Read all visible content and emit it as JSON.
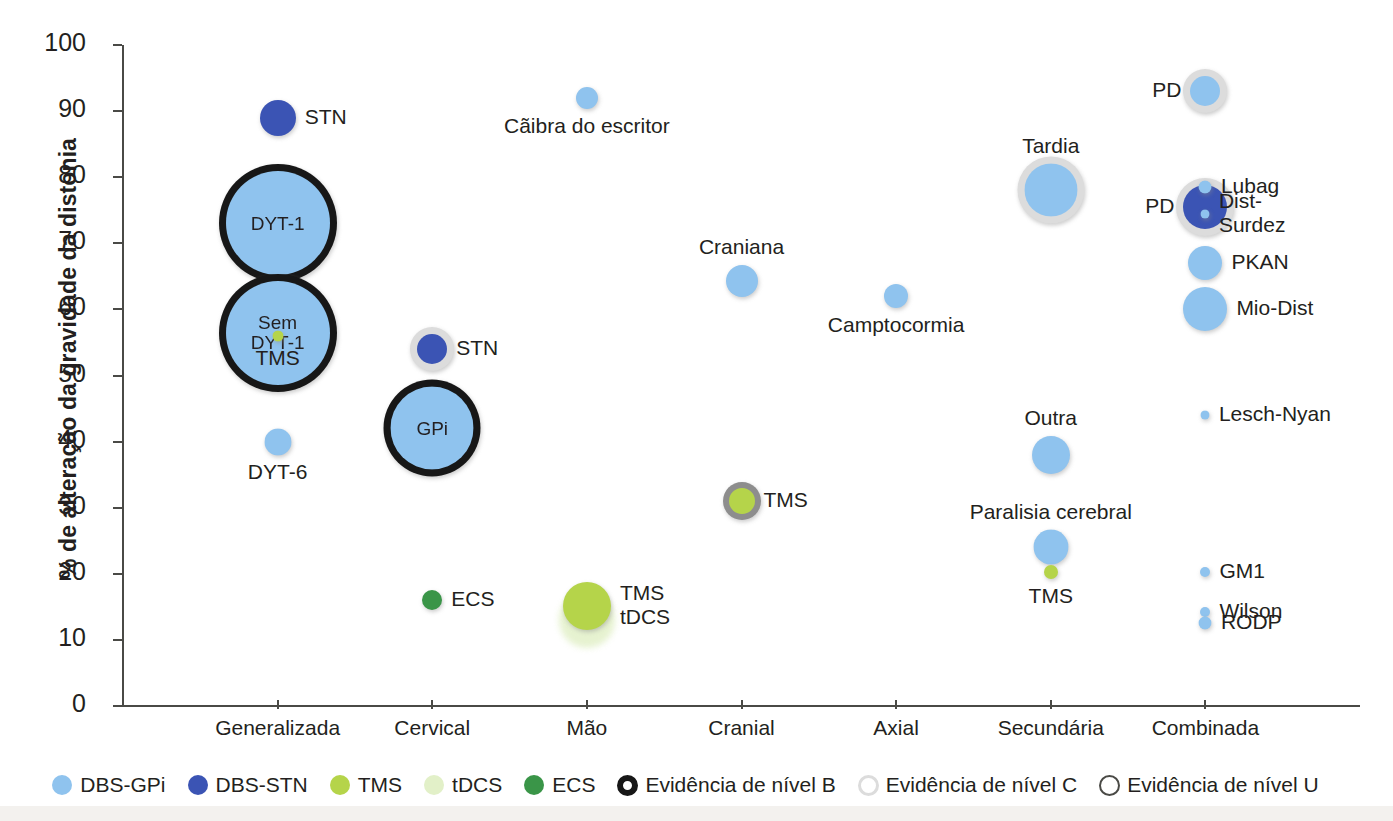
{
  "chart_data": {
    "type": "scatter",
    "title": "",
    "xlabel": "",
    "ylabel": "% de alteração da gravidade da distonia",
    "ylim": [
      0,
      100
    ],
    "ytick_labels": [
      "0",
      "10",
      "20",
      "30",
      "40",
      "50",
      "60",
      "70",
      "80",
      "90",
      "100"
    ],
    "categories": [
      "Generalizada",
      "Cervical",
      "Mão",
      "Cranial",
      "Axial",
      "Secundária",
      "Combinada"
    ],
    "grid": false,
    "legend_position": "bottom",
    "series": [
      {
        "name": "DBS-GPi",
        "color": "#8fc3ee"
      },
      {
        "name": "DBS-STN",
        "color": "#3b54b4"
      },
      {
        "name": "TMS",
        "color": "#b5d44a"
      },
      {
        "name": "tDCS",
        "color": "#e2f0c8"
      },
      {
        "name": "ECS",
        "color": "#3a9548"
      }
    ],
    "evidence_levels": [
      {
        "name": "Evidência de nível B",
        "ring": "#171717"
      },
      {
        "name": "Evidência de nível C",
        "ring": "#dcdcdc"
      },
      {
        "name": "Evidência de nível U",
        "ring": "#8d8d8d"
      }
    ],
    "points": [
      {
        "label": "STN",
        "category": "Generalizada",
        "x": 1,
        "y": 89,
        "series": "DBS-STN",
        "size": 36,
        "evidence": "none",
        "label_pos": "right",
        "label_inside": false
      },
      {
        "label": "DYT-1",
        "category": "Generalizada",
        "x": 1,
        "y": 73,
        "series": "DBS-GPi",
        "size": 104,
        "evidence": "B",
        "label_pos": "inside",
        "label_inside": true
      },
      {
        "label": "Sem\nDYT-1",
        "category": "Generalizada",
        "x": 1,
        "y": 56.5,
        "series": "DBS-GPi",
        "size": 104,
        "evidence": "B",
        "label_pos": "inside",
        "label_inside": true
      },
      {
        "label": "TMS",
        "category": "Generalizada",
        "x": 1,
        "y": 56,
        "series": "TMS",
        "size": 11,
        "evidence": "none",
        "label_pos": "below",
        "label_inside": false
      },
      {
        "label": "DYT-6",
        "category": "Generalizada",
        "x": 1,
        "y": 40,
        "series": "DBS-GPi",
        "size": 27,
        "evidence": "none",
        "label_pos": "below",
        "label_inside": false
      },
      {
        "label": "STN",
        "category": "Cervical",
        "x": 2,
        "y": 54,
        "series": "DBS-STN",
        "size": 30,
        "evidence": "C",
        "label_pos": "right",
        "label_inside": false
      },
      {
        "label": "GPi",
        "category": "Cervical",
        "x": 2,
        "y": 42,
        "series": "DBS-GPi",
        "size": 83,
        "evidence": "B",
        "label_pos": "inside",
        "label_inside": true
      },
      {
        "label": "ECS",
        "category": "Cervical",
        "x": 2,
        "y": 16,
        "series": "ECS",
        "size": 20,
        "evidence": "none",
        "label_pos": "right",
        "label_inside": false
      },
      {
        "label": "Cãibra do escritor",
        "category": "Mão",
        "x": 3,
        "y": 92,
        "series": "DBS-GPi",
        "size": 22,
        "evidence": "none",
        "label_pos": "below",
        "label_inside": false
      },
      {
        "label": "tDCS-halo",
        "category": "Mão",
        "x": 3,
        "y": 13,
        "series": "tDCS",
        "size": 56,
        "evidence": "none",
        "label_pos": "none",
        "label_inside": false
      },
      {
        "label": "TMS\ntDCS",
        "category": "Mão",
        "x": 3,
        "y": 15.2,
        "series": "TMS",
        "size": 48,
        "evidence": "none",
        "label_pos": "right",
        "label_inside": false
      },
      {
        "label": "Craniana",
        "category": "Cranial",
        "x": 4,
        "y": 64.3,
        "series": "DBS-GPi",
        "size": 32,
        "evidence": "none",
        "label_pos": "above",
        "label_inside": false
      },
      {
        "label": "TMS",
        "category": "Cranial",
        "x": 4,
        "y": 31,
        "series": "TMS",
        "size": 26,
        "evidence": "U",
        "label_pos": "right",
        "label_inside": false
      },
      {
        "label": "Camptocormia",
        "category": "Axial",
        "x": 5,
        "y": 62,
        "series": "DBS-GPi",
        "size": 24,
        "evidence": "none",
        "label_pos": "below",
        "label_inside": false
      },
      {
        "label": "Tardia",
        "category": "Secundária",
        "x": 6,
        "y": 78,
        "series": "DBS-GPi",
        "size": 53,
        "evidence": "C",
        "label_pos": "above",
        "label_inside": false
      },
      {
        "label": "Outra",
        "category": "Secundária",
        "x": 6,
        "y": 38,
        "series": "DBS-GPi",
        "size": 38,
        "evidence": "none",
        "label_pos": "above",
        "label_inside": false
      },
      {
        "label": "Paralisia cerebral",
        "category": "Secundária",
        "x": 6,
        "y": 24,
        "series": "DBS-GPi",
        "size": 35,
        "evidence": "none",
        "label_pos": "above",
        "label_inside": false
      },
      {
        "label": "TMS",
        "category": "Secundária",
        "x": 6,
        "y": 20.3,
        "series": "TMS",
        "size": 14,
        "evidence": "none",
        "label_pos": "below",
        "label_inside": false
      },
      {
        "label": "PD",
        "category": "Combinada",
        "x": 7,
        "y": 93,
        "series": "DBS-GPi",
        "size": 30,
        "evidence": "C",
        "label_pos": "left",
        "label_inside": false
      },
      {
        "label": "PD",
        "category": "Combinada",
        "x": 7,
        "y": 75.5,
        "series": "DBS-STN",
        "size": 44,
        "evidence": "C",
        "label_pos": "left",
        "label_inside": false
      },
      {
        "label": "Lubag",
        "category": "Combinada",
        "x": 7,
        "y": 78.5,
        "series": "DBS-GPi",
        "size": 13,
        "evidence": "none",
        "label_pos": "right",
        "label_inside": false
      },
      {
        "label": "Dist-\nSurdez",
        "category": "Combinada",
        "x": 7,
        "y": 74.5,
        "series": "DBS-GPi",
        "size": 9,
        "evidence": "none",
        "label_pos": "right",
        "label_inside": false
      },
      {
        "label": "PKAN",
        "category": "Combinada",
        "x": 7,
        "y": 67,
        "series": "DBS-GPi",
        "size": 34,
        "evidence": "none",
        "label_pos": "right",
        "label_inside": false
      },
      {
        "label": "Mio-Dist",
        "category": "Combinada",
        "x": 7,
        "y": 60,
        "series": "DBS-GPi",
        "size": 44,
        "evidence": "none",
        "label_pos": "right",
        "label_inside": false
      },
      {
        "label": "Lesch-Nyan",
        "category": "Combinada",
        "x": 7,
        "y": 44,
        "series": "DBS-GPi",
        "size": 9,
        "evidence": "none",
        "label_pos": "right",
        "label_inside": false
      },
      {
        "label": "GM1",
        "category": "Combinada",
        "x": 7,
        "y": 20.3,
        "series": "DBS-GPi",
        "size": 10,
        "evidence": "none",
        "label_pos": "right",
        "label_inside": false
      },
      {
        "label": "Wilson",
        "category": "Combinada",
        "x": 7,
        "y": 14.2,
        "series": "DBS-GPi",
        "size": 10,
        "evidence": "none",
        "label_pos": "right",
        "label_inside": false
      },
      {
        "label": "RODP",
        "category": "Combinada",
        "x": 7,
        "y": 12.6,
        "series": "DBS-GPi",
        "size": 13,
        "evidence": "none",
        "label_pos": "right",
        "label_inside": false
      }
    ]
  },
  "axis": {
    "y_title": "% de alteração da gravidade da distonia"
  },
  "legend": {
    "items": [
      {
        "label": "DBS-GPi",
        "kind": "dot",
        "color": "#8fc3ee",
        "size": 20
      },
      {
        "label": "DBS-STN",
        "kind": "dot",
        "color": "#3b54b4",
        "size": 20
      },
      {
        "label": "TMS",
        "kind": "dot",
        "color": "#b5d44a",
        "size": 20
      },
      {
        "label": "tDCS",
        "kind": "dot",
        "color": "#e2f0c8",
        "size": 20
      },
      {
        "label": "ECS",
        "kind": "dot",
        "color": "#3a9548",
        "size": 20
      },
      {
        "label": "Evidência de nível B",
        "kind": "ring",
        "color": "#171717",
        "size": 21,
        "stroke": 6
      },
      {
        "label": "Evidência de nível C",
        "kind": "ring",
        "color": "#dcdcdc",
        "size": 21,
        "stroke": 3
      },
      {
        "label": "Evidência de nível U",
        "kind": "ring",
        "color": "#4a4a46",
        "size": 21,
        "stroke": 2
      }
    ]
  }
}
